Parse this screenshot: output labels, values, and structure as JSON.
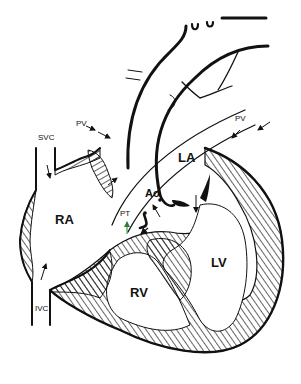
{
  "diagram": {
    "type": "anatomical heart cross-section",
    "colors": {
      "line": "#111111",
      "background": "#ffffff",
      "accent_arrow": "#2e7d32"
    },
    "labels": {
      "svc": "SVC",
      "ivc": "IVC",
      "ra": "RA",
      "rv": "RV",
      "la": "LA",
      "lv": "LV",
      "pt": "PT",
      "ao": "Ao",
      "pv_left": "PV",
      "pv_right": "PV"
    }
  }
}
